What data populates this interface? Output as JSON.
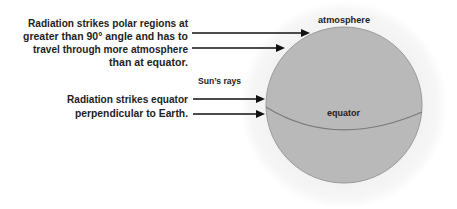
{
  "diagram": {
    "polar_caption": [
      "Radiation strikes polar regions at",
      "greater than 90° angle and has to",
      "travel through more atmosphere",
      "than at equator."
    ],
    "equator_caption": [
      "Radiation strikes equator",
      "perpendicular to Earth."
    ],
    "labels": {
      "sun_rays": "Sun’s rays",
      "atmosphere": "atmosphere",
      "equator": "equator"
    },
    "arrows": [
      {
        "name": "polar-ray-1",
        "target": "polar region (upper)"
      },
      {
        "name": "polar-ray-2",
        "target": "polar region (lower)"
      },
      {
        "name": "equator-ray-1",
        "target": "equator (above line)"
      },
      {
        "name": "equator-ray-2",
        "target": "equator (below line)"
      }
    ],
    "colors": {
      "earth_fill": "#b9b9b9",
      "earth_outline": "#9a9a9a",
      "atmosphere_halo": "#f2f2f2",
      "equator_line": "#7a7a7a",
      "text": "#1e1e1e",
      "arrow": "#111111"
    }
  }
}
